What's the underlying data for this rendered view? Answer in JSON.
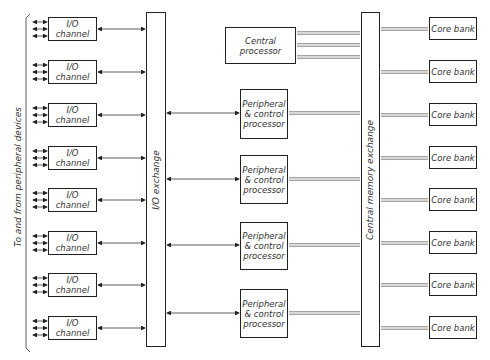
{
  "diagram": {
    "side_label": "To and from peripheral devices",
    "io_exchange_label": "I/O exchange",
    "memory_exchange_label": "Central memory exchange",
    "central_processor": "Central processor",
    "io_channels": [
      "I/O channel",
      "I/O channel",
      "I/O channel",
      "I/O channel",
      "I/O channel",
      "I/O channel",
      "I/O channel",
      "I/O channel"
    ],
    "pc_processors": [
      "Peripheral & control processor",
      "Peripheral & control processor",
      "Peripheral & control processor",
      "Peripheral & control processor"
    ],
    "core_banks": [
      "Core bank",
      "Core bank",
      "Core bank",
      "Core bank",
      "Core bank",
      "Core bank",
      "Core bank",
      "Core bank"
    ]
  }
}
